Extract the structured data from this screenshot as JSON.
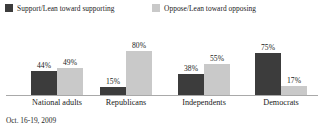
{
  "chart_data": {
    "type": "bar",
    "title": "",
    "subtitle": "",
    "xlabel": "",
    "ylabel": "",
    "ylim": [
      0,
      100
    ],
    "grid": false,
    "legend_position": "top-left",
    "value_suffix": "%",
    "categories": [
      "National adults",
      "Republicans",
      "Independents",
      "Democrats"
    ],
    "series": [
      {
        "name": "Support/Lean toward supporting",
        "color": "#3c3c3c",
        "values": [
          44,
          15,
          38,
          75
        ],
        "labels": [
          "44%",
          "15%",
          "38%",
          "75%"
        ]
      },
      {
        "name": "Oppose/Lean toward opposing",
        "color": "#c9c9c9",
        "values": [
          49,
          80,
          55,
          17
        ],
        "labels": [
          "49%",
          "80%",
          "55%",
          "17%"
        ]
      }
    ],
    "annotations": [
      "Oct. 16-19, 2009"
    ]
  },
  "legend": {
    "items": [
      {
        "label": "Support/Lean toward supporting",
        "swatch_color": "#3c3c3c"
      },
      {
        "label": "Oppose/Lean toward opposing",
        "swatch_color": "#c9c9c9"
      }
    ]
  },
  "axis": {
    "baseline_color": "#a9a9a9"
  },
  "footnote": {
    "text": "Oct. 16-19, 2009"
  },
  "colors": {
    "series_dark": "#3c3c3c",
    "series_light": "#c9c9c9",
    "text": "#1a1a1a",
    "background": "#ffffff"
  }
}
